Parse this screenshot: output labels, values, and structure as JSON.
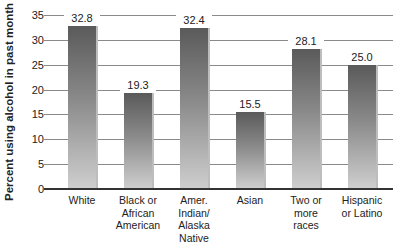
{
  "chart_data": {
    "type": "bar",
    "title": "",
    "xlabel": "",
    "ylabel": "Percent using alcohol in past month",
    "ylim": [
      0,
      35
    ],
    "yticks": [
      0,
      5,
      10,
      15,
      20,
      25,
      30,
      35
    ],
    "grid": true,
    "legend": null,
    "categories": [
      "White",
      "Black or African American",
      "Amer. Indian/ Alaska Native",
      "Asian",
      "Two or more races",
      "Hispanic or Latino"
    ],
    "category_lines": [
      [
        "White"
      ],
      [
        "Black or",
        "African",
        "American"
      ],
      [
        "Amer.",
        "Indian/",
        "Alaska",
        "Native"
      ],
      [
        "Asian"
      ],
      [
        "Two or",
        "more",
        "races"
      ],
      [
        "Hispanic",
        "or Latino"
      ]
    ],
    "values": [
      32.8,
      19.3,
      32.4,
      15.5,
      28.1,
      25.0
    ],
    "value_labels": [
      "32.8",
      "19.3",
      "32.4",
      "15.5",
      "28.1",
      "25.0"
    ]
  },
  "colors": {
    "bar_top": "#5a5a5a",
    "bar_bottom": "#cfcfcf",
    "grid": "#8a8a8a",
    "axis": "#333333"
  }
}
